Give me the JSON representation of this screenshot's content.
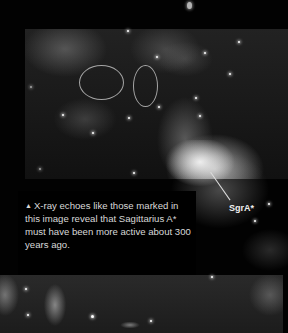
{
  "figure": {
    "marker_label": "SgrA*",
    "caption": {
      "bullet_icon": "▲",
      "text": "X-ray echoes like those marked in this image reveal that Sagittarius A* must have been more active about 300 years ago."
    },
    "annotations": {
      "ellipse_count": 2
    }
  }
}
